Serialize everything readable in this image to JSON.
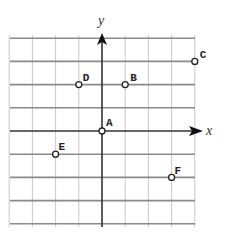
{
  "diagram": {
    "type": "coordinate-grid",
    "axes": {
      "x_label": "x",
      "y_label": "y",
      "x_range": [
        -4,
        4
      ],
      "y_range": [
        -4,
        4
      ]
    },
    "grid": {
      "origin_px": [
        102,
        131
      ],
      "unit_px": 23.2,
      "left_px": 10,
      "right_px": 195,
      "top_px": 35,
      "bottom_px": 227,
      "vertical_color": "#c8c8c8",
      "horizontal_color": "#8a8a8a",
      "axis_color": "#333333"
    },
    "points": [
      {
        "name": "A",
        "x": 0,
        "y": 0,
        "label_dx": 4,
        "label_dy": -5
      },
      {
        "name": "B",
        "x": 1,
        "y": 2,
        "label_dx": 5,
        "label_dy": -4
      },
      {
        "name": "C",
        "x": 4,
        "y": 3,
        "label_dx": 5,
        "label_dy": -3
      },
      {
        "name": "D",
        "x": -1,
        "y": 2,
        "label_dx": 4,
        "label_dy": -4
      },
      {
        "name": "E",
        "x": -2,
        "y": -1,
        "label_dx": 3,
        "label_dy": -4
      },
      {
        "name": "F",
        "x": 3,
        "y": -2,
        "label_dx": 3,
        "label_dy": -3
      }
    ]
  }
}
